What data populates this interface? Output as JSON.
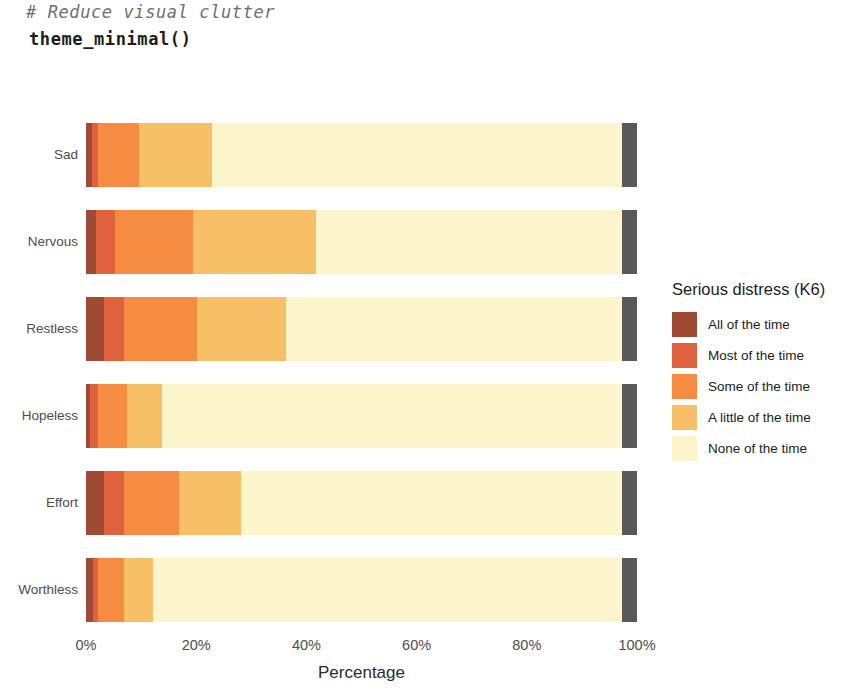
{
  "code": {
    "comment": "# Reduce visual clutter",
    "call": "theme_minimal()"
  },
  "chart_data": {
    "type": "bar",
    "orientation": "horizontal",
    "stacked": true,
    "stack_mode": "percent",
    "title": "",
    "xlabel": "Percentage",
    "ylabel": "",
    "xlim": [
      0,
      100
    ],
    "xticks": [
      0,
      20,
      40,
      60,
      80,
      100
    ],
    "xtick_labels": [
      "0%",
      "20%",
      "40%",
      "60%",
      "80%",
      "100%"
    ],
    "grid": false,
    "legend_position": "right",
    "legend_title": "Serious distress (K6)",
    "categories": [
      "Sad",
      "Nervous",
      "Restless",
      "Hopeless",
      "Effort",
      "Worthless"
    ],
    "series": [
      {
        "name": "All of the time",
        "color": "#9e4a34",
        "values": [
          1.0,
          1.9,
          3.3,
          0.8,
          3.3,
          1.3
        ]
      },
      {
        "name": "Most of the time",
        "color": "#e0613d",
        "values": [
          1.1,
          3.3,
          3.6,
          1.3,
          3.6,
          0.9
        ]
      },
      {
        "name": "Some of the time",
        "color": "#f58c42",
        "values": [
          7.6,
          14.3,
          13.2,
          5.3,
          10.0,
          4.7
        ]
      },
      {
        "name": "A little of the time",
        "color": "#f8c066",
        "values": [
          13.1,
          22.3,
          16.2,
          6.4,
          11.2,
          5.3
        ]
      },
      {
        "name": "None of the time",
        "color": "#fcf5cc",
        "values": [
          74.5,
          55.5,
          61.0,
          83.5,
          69.2,
          85.1
        ]
      },
      {
        "name": "Missing",
        "color": "#595959",
        "values": [
          2.7,
          2.7,
          2.7,
          2.7,
          2.7,
          2.7
        ]
      }
    ]
  },
  "axis": {
    "x_title": "Percentage"
  },
  "legend": {
    "title": "Serious distress (K6)",
    "items": [
      {
        "label": "All of the time",
        "color": "#9e4a34"
      },
      {
        "label": "Most of the time",
        "color": "#e0613d"
      },
      {
        "label": "Some of the time",
        "color": "#f58c42"
      },
      {
        "label": "A little of the time",
        "color": "#f8c066"
      },
      {
        "label": "None of the time",
        "color": "#fcf5cc"
      }
    ]
  }
}
